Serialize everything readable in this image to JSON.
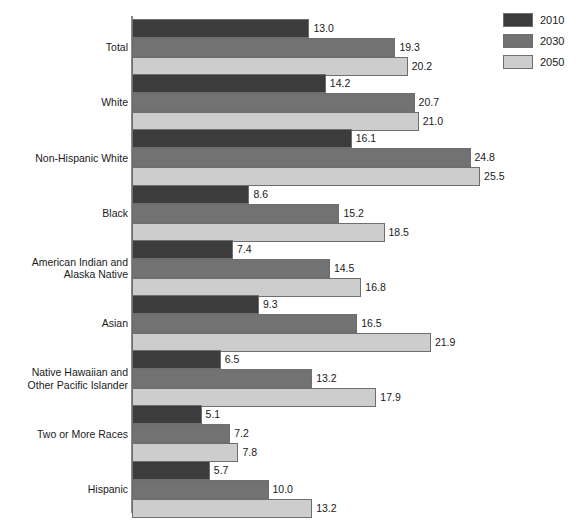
{
  "chart_data": {
    "type": "bar",
    "orientation": "horizontal",
    "title": "",
    "subtitle": "",
    "xlabel": "",
    "ylabel": "",
    "grid": false,
    "xlim": [
      0,
      26
    ],
    "legend_position": "top-right",
    "categories": [
      "Total",
      "White",
      "Non-Hispanic White",
      "Black",
      "American Indian and Alaska Native",
      "Asian",
      "Native Hawaiian and Other Pacific Islander",
      "Two or More Races",
      "Hispanic"
    ],
    "series": [
      {
        "name": "2010",
        "color": "#3c3c3c",
        "values": [
          13.0,
          14.2,
          16.1,
          8.6,
          7.4,
          9.3,
          6.5,
          5.1,
          5.7
        ],
        "labels": [
          "13.0",
          "14.2",
          "16.1",
          "8.6",
          "7.4",
          "9.3",
          "6.5",
          "5.1",
          "5.7"
        ]
      },
      {
        "name": "2030",
        "color": "#727272",
        "values": [
          19.3,
          20.7,
          24.8,
          15.2,
          14.5,
          16.5,
          13.2,
          7.2,
          10.0
        ],
        "labels": [
          "19.3",
          "20.7",
          "24.8",
          "15.2",
          "14.5",
          "16.5",
          "13.2",
          "7.2",
          "10.0"
        ]
      },
      {
        "name": "2050",
        "color": "#cdcdcd",
        "values": [
          20.2,
          21.0,
          25.5,
          18.5,
          16.8,
          21.9,
          17.9,
          7.8,
          13.2
        ],
        "labels": [
          "20.2",
          "21.0",
          "25.5",
          "18.5",
          "16.8",
          "21.9",
          "17.9",
          "7.8",
          "13.2"
        ]
      }
    ]
  },
  "legend": {
    "entries": [
      {
        "label": "2010",
        "color": "#3c3c3c"
      },
      {
        "label": "2030",
        "color": "#727272"
      },
      {
        "label": "2050",
        "color": "#cdcdcd"
      }
    ]
  },
  "axis": {
    "color": "#8a8a8a"
  },
  "category_labels": [
    [
      "Total"
    ],
    [
      "White"
    ],
    [
      "Non-Hispanic White"
    ],
    [
      "Black"
    ],
    [
      "American Indian and",
      "Alaska Native"
    ],
    [
      "Asian"
    ],
    [
      "Native Hawaiian and",
      "Other Pacific Islander"
    ],
    [
      "Two or More Races"
    ],
    [
      "Hispanic"
    ]
  ]
}
